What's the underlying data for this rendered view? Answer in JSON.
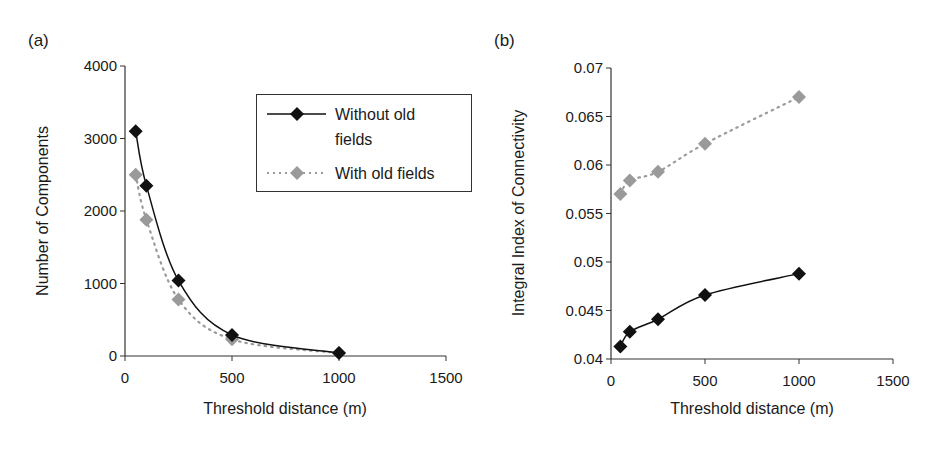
{
  "colors": {
    "series_without": "#111111",
    "series_with": "#9a9a9a",
    "axis": "#333333",
    "background": "#ffffff"
  },
  "legend": {
    "entries": [
      {
        "label_line1": "Without old",
        "label_line2": "fields",
        "style": "solid",
        "marker": "diamond"
      },
      {
        "label_line1": "With old fields",
        "label_line2": "",
        "style": "dotted",
        "marker": "diamond"
      }
    ]
  },
  "panels": {
    "a": {
      "label": "(a)"
    },
    "b": {
      "label": "(b)"
    }
  },
  "chart_data": [
    {
      "type": "line",
      "panel": "(a)",
      "title": "",
      "xlabel": "Threshold distance (m)",
      "ylabel": "Number of Components",
      "xlim": [
        0,
        1500
      ],
      "ylim": [
        0,
        4000
      ],
      "x_ticks": [
        "0",
        "500",
        "1000",
        "1500"
      ],
      "y_ticks": [
        "0",
        "1000",
        "2000",
        "3000",
        "4000"
      ],
      "grid": false,
      "legend_position": "upper right (inside)",
      "x": [
        50,
        100,
        250,
        500,
        1000
      ],
      "series": [
        {
          "name": "Without old fields",
          "line": "solid",
          "marker": "diamond",
          "color": "#111111",
          "values": [
            3100,
            2350,
            1040,
            290,
            40
          ]
        },
        {
          "name": "With old fields",
          "line": "dotted",
          "marker": "diamond",
          "color": "#9a9a9a",
          "values": [
            2500,
            1880,
            780,
            230,
            40
          ]
        }
      ]
    },
    {
      "type": "line",
      "panel": "(b)",
      "title": "",
      "xlabel": "Threshold distance (m)",
      "ylabel": "Integral Index of Connectivity",
      "xlim": [
        0,
        1500
      ],
      "ylim": [
        0.04,
        0.07
      ],
      "x_ticks": [
        "0",
        "500",
        "1000",
        "1500"
      ],
      "y_ticks": [
        "0.04",
        "0.045",
        "0.05",
        "0.055",
        "0.06",
        "0.065",
        "0.07"
      ],
      "grid": false,
      "legend_position": "none (shared with panel a)",
      "x": [
        50,
        100,
        250,
        500,
        1000
      ],
      "series": [
        {
          "name": "Without old fields",
          "line": "solid",
          "marker": "diamond",
          "color": "#111111",
          "values": [
            0.0413,
            0.0428,
            0.0441,
            0.0466,
            0.0488
          ]
        },
        {
          "name": "With old fields",
          "line": "dotted",
          "marker": "diamond",
          "color": "#9a9a9a",
          "values": [
            0.057,
            0.0584,
            0.0593,
            0.0622,
            0.067
          ]
        }
      ]
    }
  ]
}
